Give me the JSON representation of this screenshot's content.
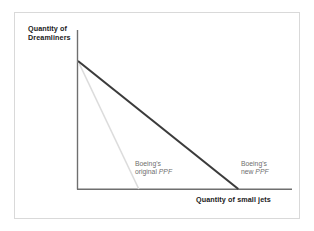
{
  "figure": {
    "name": "production-possibility-frontier-diagram",
    "background_color": "#ffffff",
    "frame_color": "#d9d9d9"
  },
  "axes": {
    "y_title_line1": "Quantity of",
    "y_title_line2": "Dreamliners",
    "x_title": "Quantity of small jets",
    "axis_color": "#6f6f6f"
  },
  "annotations": {
    "original": {
      "line1": "Boeing's",
      "line2_prefix": "original ",
      "line2_italic": "PPF"
    },
    "new": {
      "line1": "Boeing's",
      "line2_prefix": "new ",
      "line2_italic": "PPF"
    },
    "text_color": "#6e6e6e"
  },
  "chart_data": {
    "type": "line",
    "title": "",
    "subtitle": "",
    "xlabel": "Quantity of small jets",
    "ylabel": "Quantity of Dreamliners",
    "grid": false,
    "legend_position": "inline-annotations",
    "xlim": [
      0,
      100
    ],
    "ylim": [
      0,
      100
    ],
    "axis_ticks": {
      "x": [],
      "y": []
    },
    "series": [
      {
        "name": "Boeing's original PPF",
        "color": "#dcdcdc",
        "width": 1.6,
        "points": [
          {
            "x": 0,
            "y": 80
          },
          {
            "x": 28.4,
            "y": 0
          }
        ]
      },
      {
        "name": "Boeing's new PPF",
        "color": "#3b3b3b",
        "width": 2.1,
        "points": [
          {
            "x": 0,
            "y": 80
          },
          {
            "x": 74.9,
            "y": 0
          }
        ]
      }
    ]
  }
}
